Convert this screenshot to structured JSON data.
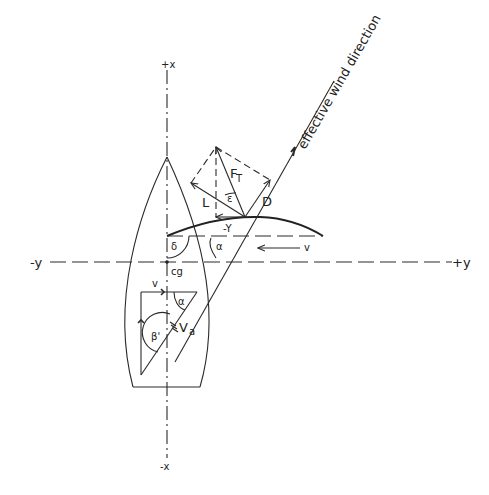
{
  "diagram": {
    "axes": {
      "plus_x": "+x",
      "minus_x": "-x",
      "plus_y": "+y",
      "minus_y": "-y"
    },
    "labels": {
      "wind": "effective wind direction",
      "total_force": "F",
      "total_force_sub": "T",
      "lift": "L",
      "drag": "D",
      "side_force": "-Y",
      "epsilon": "ε",
      "delta": "δ",
      "alpha_sail": "α",
      "alpha_hull": "α",
      "boat_speed_top": "v",
      "boat_speed_side": "v",
      "beta": "β'",
      "apparent_wind": "V",
      "apparent_wind_sub": "a",
      "center_of_gravity": "cg"
    },
    "colors": {
      "ink": "#2a2a2a",
      "background": "#ffffff"
    }
  }
}
